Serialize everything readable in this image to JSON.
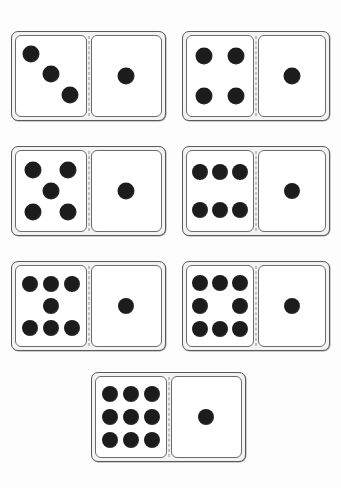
{
  "page": {
    "background_color": "#fdfdfd",
    "width": 341,
    "height": 488,
    "pip_color": "#1c1c1c",
    "tile_border_color": "#5a5a5a",
    "tile_fill_color": "#f3f3f3",
    "half_fill_color": "#ffffff",
    "divider_style": "dashed",
    "divider_color": "#8e8e8e"
  },
  "layout": {
    "rows": 4,
    "columns_per_row": [
      2,
      2,
      2,
      1
    ],
    "description": "Seven horizontal dominoes arranged in four rows; the last row holds a single centred tile."
  },
  "dominoes": [
    {
      "id": "domino-3-1",
      "label": "3 | 1",
      "left_value": 3,
      "right_value": 1,
      "total": 4,
      "x": 11,
      "y": 31,
      "w": 155,
      "h": 90,
      "left_pips": [
        {
          "cx": 22,
          "cy": 22
        },
        {
          "cx": 50,
          "cy": 48
        },
        {
          "cx": 78,
          "cy": 74
        }
      ],
      "right_pips": [
        {
          "cx": 50,
          "cy": 50
        }
      ],
      "pip_d": 17
    },
    {
      "id": "domino-4-1",
      "label": "4 | 1",
      "left_value": 4,
      "right_value": 1,
      "total": 5,
      "x": 182,
      "y": 31,
      "w": 148,
      "h": 90,
      "left_pips": [
        {
          "cx": 26,
          "cy": 25
        },
        {
          "cx": 74,
          "cy": 25
        },
        {
          "cx": 26,
          "cy": 75
        },
        {
          "cx": 74,
          "cy": 75
        }
      ],
      "right_pips": [
        {
          "cx": 50,
          "cy": 50
        }
      ],
      "pip_d": 17
    },
    {
      "id": "domino-5-1",
      "label": "5 | 1",
      "left_value": 5,
      "right_value": 1,
      "total": 6,
      "x": 11,
      "y": 146,
      "w": 155,
      "h": 90,
      "left_pips": [
        {
          "cx": 25,
          "cy": 24
        },
        {
          "cx": 75,
          "cy": 24
        },
        {
          "cx": 50,
          "cy": 50
        },
        {
          "cx": 25,
          "cy": 76
        },
        {
          "cx": 75,
          "cy": 76
        }
      ],
      "right_pips": [
        {
          "cx": 50,
          "cy": 50
        }
      ],
      "pip_d": 17
    },
    {
      "id": "domino-6-1",
      "label": "6 | 1",
      "left_value": 6,
      "right_value": 1,
      "total": 7,
      "x": 182,
      "y": 146,
      "w": 148,
      "h": 90,
      "left_pips": [
        {
          "cx": 20,
          "cy": 26
        },
        {
          "cx": 50,
          "cy": 26
        },
        {
          "cx": 80,
          "cy": 26
        },
        {
          "cx": 20,
          "cy": 74
        },
        {
          "cx": 50,
          "cy": 74
        },
        {
          "cx": 80,
          "cy": 74
        }
      ],
      "right_pips": [
        {
          "cx": 50,
          "cy": 50
        }
      ],
      "pip_d": 16
    },
    {
      "id": "domino-7-1",
      "label": "7 | 1",
      "left_value": 7,
      "right_value": 1,
      "total": 8,
      "x": 11,
      "y": 261,
      "w": 155,
      "h": 90,
      "left_pips": [
        {
          "cx": 20,
          "cy": 22
        },
        {
          "cx": 50,
          "cy": 22
        },
        {
          "cx": 80,
          "cy": 22
        },
        {
          "cx": 50,
          "cy": 50
        },
        {
          "cx": 20,
          "cy": 78
        },
        {
          "cx": 50,
          "cy": 78
        },
        {
          "cx": 80,
          "cy": 78
        }
      ],
      "right_pips": [
        {
          "cx": 50,
          "cy": 50
        }
      ],
      "pip_d": 16
    },
    {
      "id": "domino-8-1",
      "label": "8 | 1",
      "left_value": 8,
      "right_value": 1,
      "total": 9,
      "x": 182,
      "y": 261,
      "w": 148,
      "h": 90,
      "left_pips": [
        {
          "cx": 20,
          "cy": 21
        },
        {
          "cx": 50,
          "cy": 21
        },
        {
          "cx": 80,
          "cy": 21
        },
        {
          "cx": 20,
          "cy": 50
        },
        {
          "cx": 80,
          "cy": 50
        },
        {
          "cx": 20,
          "cy": 79
        },
        {
          "cx": 50,
          "cy": 79
        },
        {
          "cx": 80,
          "cy": 79
        }
      ],
      "right_pips": [
        {
          "cx": 50,
          "cy": 50
        }
      ],
      "pip_d": 16
    },
    {
      "id": "domino-9-1",
      "label": "9 | 1",
      "left_value": 9,
      "right_value": 1,
      "total": 10,
      "x": 91,
      "y": 372,
      "w": 155,
      "h": 90,
      "left_pips": [
        {
          "cx": 20,
          "cy": 21
        },
        {
          "cx": 50,
          "cy": 21
        },
        {
          "cx": 80,
          "cy": 21
        },
        {
          "cx": 20,
          "cy": 50
        },
        {
          "cx": 50,
          "cy": 50
        },
        {
          "cx": 80,
          "cy": 50
        },
        {
          "cx": 20,
          "cy": 79
        },
        {
          "cx": 50,
          "cy": 79
        },
        {
          "cx": 80,
          "cy": 79
        }
      ],
      "right_pips": [
        {
          "cx": 50,
          "cy": 50
        }
      ],
      "pip_d": 16
    }
  ]
}
